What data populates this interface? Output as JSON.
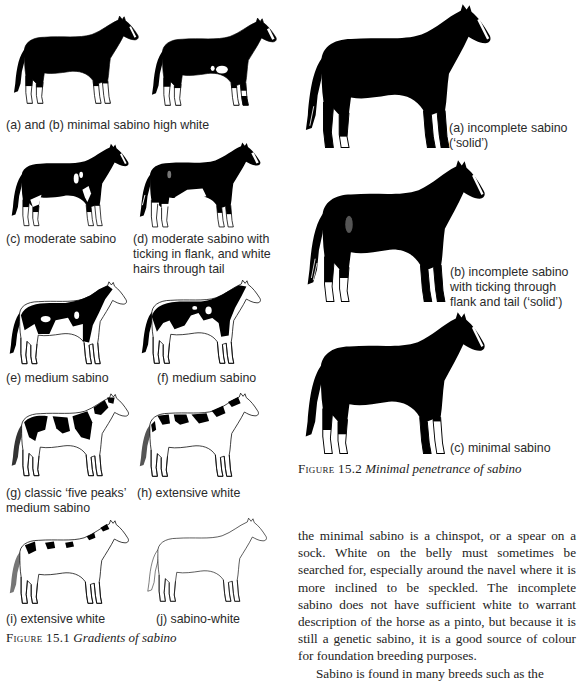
{
  "figure_15_1": {
    "label": "Figure 15.1",
    "title": "Gradients of sabino",
    "panels": [
      {
        "id": "a_b",
        "caption": "(a) and (b) minimal sabino high white"
      },
      {
        "id": "c",
        "caption": "(c) moderate sabino"
      },
      {
        "id": "d",
        "caption_lines": [
          "(d) moderate sabino with",
          "ticking in flank, and white",
          "hairs through tail"
        ]
      },
      {
        "id": "e",
        "caption": "(e) medium sabino"
      },
      {
        "id": "f",
        "caption": "(f) medium sabino"
      },
      {
        "id": "g",
        "caption_lines": [
          "(g) classic ‘five peaks’",
          "medium sabino"
        ]
      },
      {
        "id": "h",
        "caption": "(h) extensive white"
      },
      {
        "id": "i",
        "caption": "(i) extensive white"
      },
      {
        "id": "j",
        "caption": "(j) sabino-white"
      }
    ]
  },
  "figure_15_2": {
    "label": "Figure 15.2",
    "title": "Minimal penetrance of sabino",
    "panels": [
      {
        "id": "a",
        "caption_lines": [
          "(a) incomplete sabino",
          "(‘solid’)"
        ]
      },
      {
        "id": "b",
        "caption_lines": [
          "(b) incomplete sabino",
          "with ticking through",
          "flank and tail (‘solid’)"
        ]
      },
      {
        "id": "c",
        "caption": "(c) minimal sabino"
      }
    ]
  },
  "body_text": {
    "paragraphs": [
      "the minimal sabino is a chinspot, or a spear on a sock. White on the belly must sometimes be searched for, especially around the navel where it is more inclined to be speckled. The incomplete sabino does not have sufficient white to warrant description of the horse as a pinto, but because it is still a genetic sabino, it is a good source of colour for foundation breeding purposes.",
      "Sabino is found in many breeds such as the"
    ]
  }
}
